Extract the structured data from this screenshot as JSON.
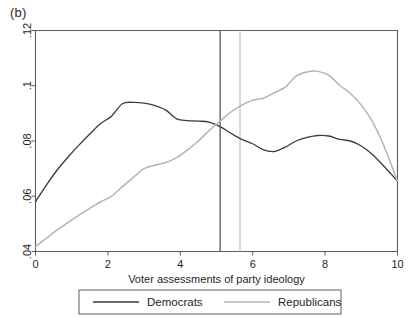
{
  "panel": {
    "label": "(b)"
  },
  "chart_data": {
    "type": "line",
    "title": "(b)",
    "subtitle": "",
    "xlabel": "Voter assessments of party ideology",
    "ylabel": "",
    "xlim": [
      0,
      10
    ],
    "ylim": [
      0.04,
      0.12
    ],
    "grid": false,
    "legend_position": "bottom",
    "xticks": [
      0,
      2,
      4,
      6,
      8,
      10
    ],
    "xticklabels": [
      "0",
      "2",
      "4",
      "6",
      "8",
      "10"
    ],
    "yticks": [
      0.04,
      0.06,
      0.08,
      0.1,
      0.12
    ],
    "yticklabels": [
      ".04",
      ".06",
      ".08",
      ".1",
      ".12"
    ],
    "series": [
      {
        "name": "Democrats",
        "color": "#3d3d3d",
        "x": [
          0.0,
          0.3,
          0.6,
          0.9,
          1.2,
          1.5,
          1.8,
          2.1,
          2.4,
          2.7,
          3.0,
          3.3,
          3.6,
          3.9,
          4.2,
          4.5,
          4.8,
          5.1,
          5.4,
          5.7,
          6.0,
          6.3,
          6.6,
          6.9,
          7.2,
          7.5,
          7.8,
          8.1,
          8.4,
          8.7,
          9.0,
          9.3,
          9.6,
          10.0
        ],
        "y": [
          0.058,
          0.064,
          0.0695,
          0.0742,
          0.0785,
          0.0825,
          0.0863,
          0.089,
          0.0935,
          0.094,
          0.0937,
          0.0928,
          0.0912,
          0.088,
          0.0874,
          0.0872,
          0.0868,
          0.0852,
          0.0828,
          0.0806,
          0.079,
          0.0768,
          0.0762,
          0.0778,
          0.08,
          0.0813,
          0.082,
          0.0818,
          0.0806,
          0.08,
          0.0782,
          0.0752,
          0.0712,
          0.0655
        ]
      },
      {
        "name": "Republicans",
        "color": "#b4b4b4",
        "x": [
          0.0,
          0.3,
          0.6,
          0.9,
          1.2,
          1.5,
          1.8,
          2.1,
          2.4,
          2.7,
          3.0,
          3.3,
          3.6,
          3.9,
          4.2,
          4.5,
          4.8,
          5.1,
          5.4,
          5.7,
          6.0,
          6.3,
          6.6,
          6.9,
          7.2,
          7.5,
          7.8,
          8.1,
          8.4,
          8.7,
          9.0,
          9.3,
          9.6,
          10.0
        ],
        "y": [
          0.0418,
          0.0448,
          0.0478,
          0.0505,
          0.0532,
          0.0556,
          0.058,
          0.06,
          0.0635,
          0.0668,
          0.07,
          0.0712,
          0.0722,
          0.074,
          0.0768,
          0.08,
          0.0838,
          0.0872,
          0.0905,
          0.093,
          0.0948,
          0.0955,
          0.0975,
          0.0995,
          0.1035,
          0.105,
          0.1052,
          0.1038,
          0.1002,
          0.0972,
          0.093,
          0.0872,
          0.079,
          0.0655
        ]
      }
    ],
    "vertical_lines": [
      {
        "name": "democrat-mean-line",
        "x": 5.1,
        "color": "#4a4a4a"
      },
      {
        "name": "republican-mean-line",
        "x": 5.65,
        "color": "#c0c0c0"
      }
    ],
    "legend": [
      {
        "label": "Democrats",
        "color": "#3d3d3d"
      },
      {
        "label": "Republicans",
        "color": "#b4b4b4"
      }
    ]
  }
}
